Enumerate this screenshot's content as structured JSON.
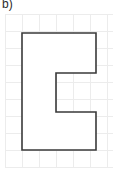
{
  "label": {
    "text": "b)"
  },
  "colors": {
    "background": "#ffffff",
    "grid_line": "#ececec",
    "shape_stroke": "#3a3a3a",
    "shape_fill": "#ffffff",
    "label_text": "#2b2b2b"
  },
  "grid": {
    "columns": 6,
    "rows": 8,
    "cell_size": 17,
    "origin_x": 5,
    "origin_y": 14,
    "x_lines": [
      5,
      22,
      39,
      56,
      73,
      90,
      107
    ],
    "y_lines": [
      14,
      31,
      48,
      65,
      82,
      99,
      116,
      133,
      150,
      167
    ],
    "stroke_width": 1
  },
  "shape": {
    "name": "block-letter-C",
    "stroke_width": 1.6,
    "points": [
      {
        "x": 22,
        "y": 33
      },
      {
        "x": 96,
        "y": 33
      },
      {
        "x": 96,
        "y": 73
      },
      {
        "x": 56,
        "y": 73
      },
      {
        "x": 56,
        "y": 112
      },
      {
        "x": 96,
        "y": 112
      },
      {
        "x": 96,
        "y": 150
      },
      {
        "x": 22,
        "y": 150
      }
    ],
    "path": "M22,33 L96,33 L96,73 L56,73 L56,112 L96,112 L96,150 L22,150 Z"
  }
}
